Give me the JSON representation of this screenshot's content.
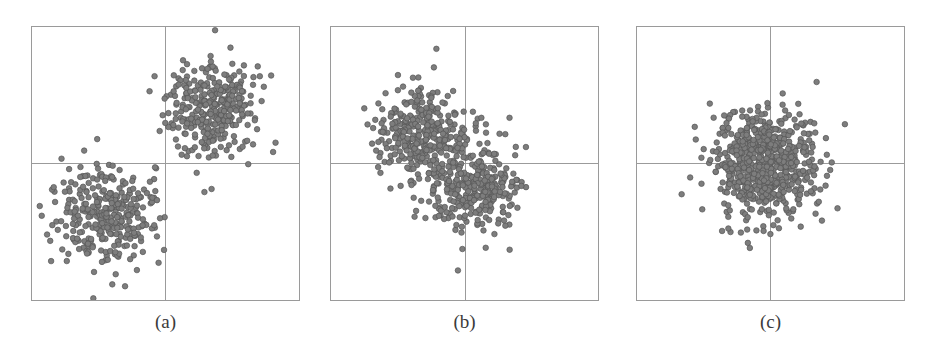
{
  "figure": {
    "panel_count": 3,
    "marker_color": "#7d7d7d",
    "marker_edge_color": "#555555",
    "border_color": "#9a9a9a",
    "axis_color": "#9a9a9a",
    "background": "#ffffff"
  },
  "panels": [
    {
      "id": "a",
      "caption": "(a)"
    },
    {
      "id": "b",
      "caption": "(b)"
    },
    {
      "id": "c",
      "caption": "(c)"
    }
  ],
  "chart_data": [
    {
      "type": "scatter",
      "title": "(a)",
      "xlabel": "",
      "ylabel": "",
      "xlim": [
        -1,
        1
      ],
      "ylim": [
        -1,
        1
      ],
      "grid": false,
      "axes_crosshair": {
        "x": 0,
        "y": 0
      },
      "tick_labels": {
        "x": [],
        "y": []
      },
      "legend": [],
      "annotations": [],
      "series": [
        {
          "name": "cluster-1",
          "n_points": 330,
          "center": [
            -0.44,
            -0.4
          ],
          "spread": [
            0.2,
            0.19
          ],
          "color": "#7d7d7d"
        },
        {
          "name": "cluster-2",
          "n_points": 330,
          "center": [
            0.36,
            0.4
          ],
          "spread": [
            0.17,
            0.18
          ],
          "color": "#7d7d7d"
        }
      ]
    },
    {
      "type": "scatter",
      "title": "(b)",
      "xlabel": "",
      "ylabel": "",
      "xlim": [
        -1,
        1
      ],
      "ylim": [
        -1,
        1
      ],
      "grid": false,
      "axes_crosshair": {
        "x": 0,
        "y": 0
      },
      "tick_labels": {
        "x": [],
        "y": []
      },
      "legend": [],
      "annotations": [],
      "series": [
        {
          "name": "cluster-1",
          "n_points": 330,
          "center": [
            -0.33,
            0.21
          ],
          "spread": [
            0.17,
            0.17
          ],
          "color": "#7d7d7d"
        },
        {
          "name": "cluster-2",
          "n_points": 330,
          "center": [
            0.06,
            -0.16
          ],
          "spread": [
            0.17,
            0.17
          ],
          "color": "#7d7d7d"
        }
      ]
    },
    {
      "type": "scatter",
      "title": "(c)",
      "xlabel": "",
      "ylabel": "",
      "xlim": [
        -1,
        1
      ],
      "ylim": [
        -1,
        1
      ],
      "grid": false,
      "axes_crosshair": {
        "x": 0,
        "y": 0
      },
      "tick_labels": {
        "x": [],
        "y": []
      },
      "legend": [],
      "annotations": [],
      "series": [
        {
          "name": "cluster-1",
          "n_points": 330,
          "center": [
            -0.1,
            0.02
          ],
          "spread": [
            0.19,
            0.2
          ],
          "color": "#7d7d7d"
        },
        {
          "name": "cluster-2",
          "n_points": 330,
          "center": [
            0.02,
            -0.03
          ],
          "spread": [
            0.19,
            0.2
          ],
          "color": "#7d7d7d"
        }
      ]
    }
  ]
}
